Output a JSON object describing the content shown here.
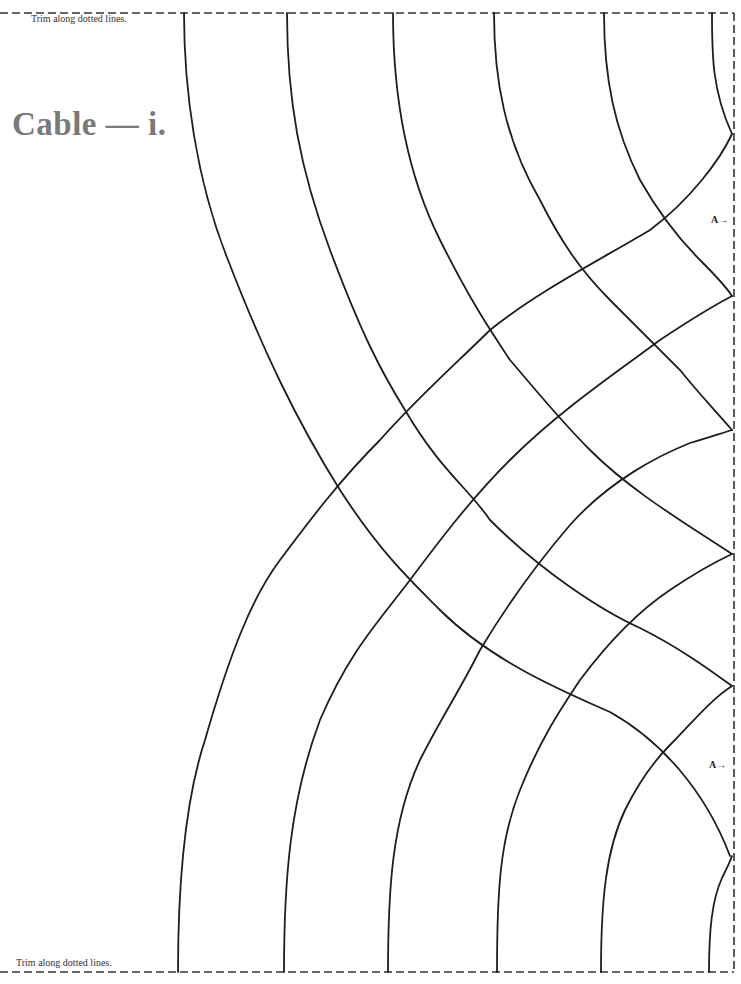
{
  "page": {
    "title": "Cable — i.",
    "trim_note_top": "Trim along dotted lines.",
    "trim_note_bottom": "Trim along dotted lines.",
    "markers": [
      {
        "label": "A→",
        "y": 221
      },
      {
        "label": "A→",
        "y": 766
      }
    ]
  },
  "colors": {
    "line": "#1e1e1e",
    "dash": "#333333",
    "title": "#7a7a7a"
  }
}
